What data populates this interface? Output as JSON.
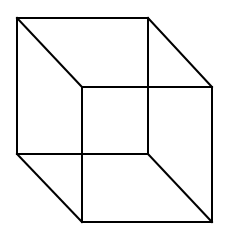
{
  "diagram": {
    "stroke_color": "#000000",
    "background": "#ffffff",
    "vertices": {
      "back_top_left": [
        17,
        18
      ],
      "back_top_right": [
        148,
        18
      ],
      "back_bottom_left": [
        17,
        154
      ],
      "back_bottom_right": [
        148,
        154
      ],
      "front_top_left": [
        82,
        87
      ],
      "front_top_right": [
        212,
        87
      ],
      "front_bottom_left": [
        82,
        222
      ],
      "front_bottom_right": [
        212,
        222
      ]
    },
    "edges": [
      [
        "back_top_left",
        "back_top_right"
      ],
      [
        "back_top_right",
        "back_bottom_right"
      ],
      [
        "back_bottom_right",
        "back_bottom_left"
      ],
      [
        "back_bottom_left",
        "back_top_left"
      ],
      [
        "front_top_left",
        "front_top_right"
      ],
      [
        "front_top_right",
        "front_bottom_right"
      ],
      [
        "front_bottom_right",
        "front_bottom_left"
      ],
      [
        "front_bottom_left",
        "front_top_left"
      ],
      [
        "back_top_left",
        "front_top_left"
      ],
      [
        "back_top_right",
        "front_top_right"
      ],
      [
        "back_bottom_left",
        "front_bottom_left"
      ],
      [
        "back_bottom_right",
        "front_bottom_right"
      ]
    ]
  }
}
